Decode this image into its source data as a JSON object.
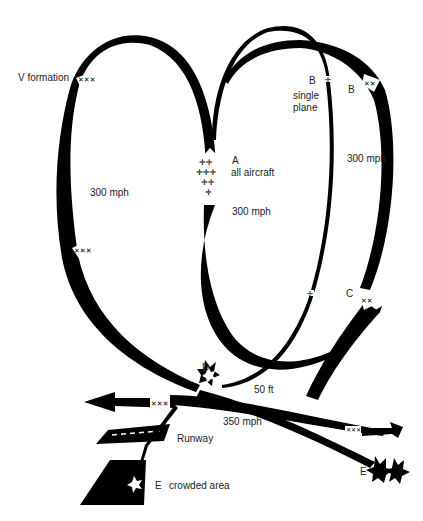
{
  "diagram": {
    "type": "flight-path diagram",
    "ink_color": "#000000",
    "background": "#ffffff",
    "labels": {
      "v_formation": "V formation",
      "left_speed": "300 mph",
      "a_letter": "A",
      "a_desc": "all aircraft",
      "center_speed": "300 mph",
      "b1_letter": "B",
      "b1_desc_1": "single",
      "b1_desc_2": "plane",
      "b2_letter": "B",
      "right_speed": "300 mph",
      "c_letter": "C",
      "d_letter": "D",
      "altitude": "50 ft",
      "low_speed": "350 mph",
      "runway": "Runway",
      "e_left_letter": "E",
      "e_left_desc": "crowded area",
      "e_right_letter": "E"
    },
    "points": [
      {
        "id": "A",
        "description": "all aircraft"
      },
      {
        "id": "B",
        "description": "single plane"
      },
      {
        "id": "B",
        "description": "formation"
      },
      {
        "id": "C",
        "description": "formation rejoins"
      },
      {
        "id": "D",
        "description": "collision"
      },
      {
        "id": "E",
        "description": "crowded area"
      },
      {
        "id": "E",
        "description": "crash"
      }
    ]
  }
}
